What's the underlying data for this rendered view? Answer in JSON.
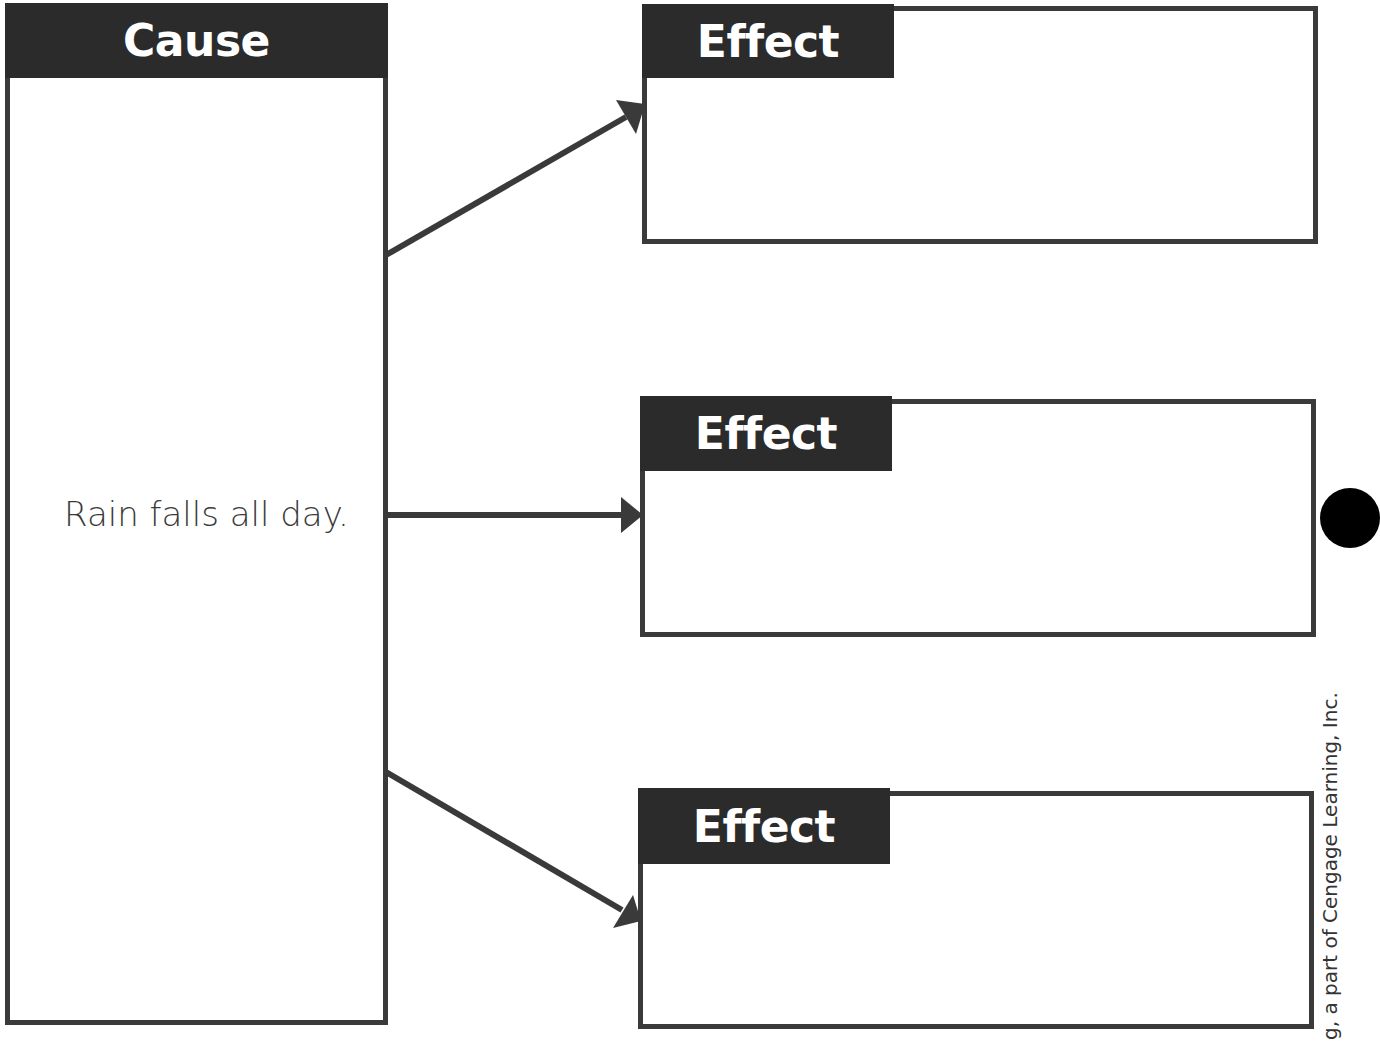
{
  "cause": {
    "header": "Cause",
    "text": "Rain falls all day."
  },
  "effects": [
    {
      "header": "Effect",
      "text": ""
    },
    {
      "header": "Effect",
      "text": ""
    },
    {
      "header": "Effect",
      "text": ""
    }
  ],
  "footer": {
    "copyright": "g, a part of Cengage Learning, Inc."
  },
  "colors": {
    "header_bg": "#2b2b2b",
    "border": "#3a3a3a",
    "header_text": "#ffffff"
  }
}
